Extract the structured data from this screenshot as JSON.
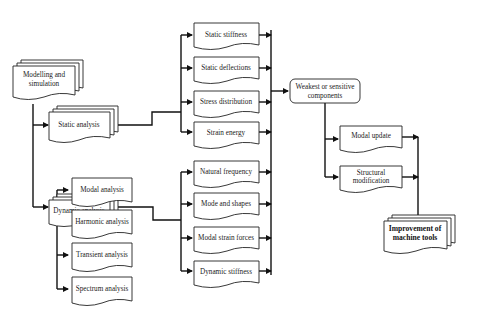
{
  "diagram": {
    "root": {
      "label_lines": [
        "Modelling and",
        "simulation"
      ]
    },
    "analysis": {
      "static": {
        "label": "Static analysis"
      },
      "dynamic": {
        "label": "Dynamic analysis"
      }
    },
    "dynamic_types": [
      {
        "label": "Modal analysis"
      },
      {
        "label": "Harmonic analysis"
      },
      {
        "label": "Transient analysis"
      },
      {
        "label": "Spectrum analysis"
      }
    ],
    "static_results": [
      {
        "label": "Static stiffness"
      },
      {
        "label": "Static deflections"
      },
      {
        "label": "Stress distribution"
      },
      {
        "label": "Strain energy"
      }
    ],
    "dynamic_results": [
      {
        "label": "Natural frequency"
      },
      {
        "label": "Mode and shapes"
      },
      {
        "label": "Modal strain forces"
      },
      {
        "label": "Dynamic stiffness"
      }
    ],
    "weakest": {
      "label_lines": [
        "Weakest or sensitive",
        "components"
      ]
    },
    "actions": [
      {
        "label_lines": [
          "Modal update"
        ]
      },
      {
        "label_lines": [
          "Structural",
          "modification"
        ]
      }
    ],
    "final": {
      "label_lines": [
        "Improvement of",
        "machine tools"
      ]
    }
  }
}
